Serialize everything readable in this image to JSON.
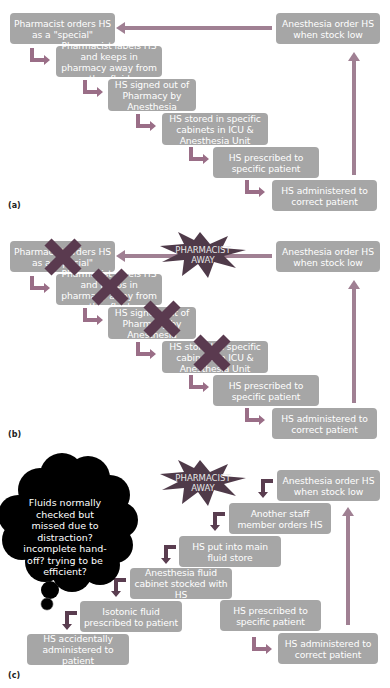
{
  "colors": {
    "box_fill": "#a6a6a6",
    "box_text": "#ffffff",
    "elbow_arrow": "#9a6e87",
    "long_arrow": "#a08093",
    "cross": "#5a3a4f",
    "star_fill": "#4f3a49",
    "dark_arrow": "#5a3d50",
    "cloud": "#000000"
  },
  "panel_a": {
    "label": "(a)",
    "boxes": [
      "Pharmacist orders HS as a \"special\"",
      "Pharmacist labels HS and keeps in pharmacy away from other fluids",
      "HS signed out of Pharmacy by Anesthesia",
      "HS stored in specific cabinets in ICU & Anesthesia Unit",
      "HS prescribed to specific patient",
      "HS administered to correct patient",
      "Anesthesia order HS when stock low"
    ]
  },
  "panel_b": {
    "label": "(b)",
    "star": "PHARMACIST AWAY",
    "boxes": [
      "Pharmacist orders HS as a \"special\"",
      "Pharmacist labels HS and keeps in pharmacy away from other fluids",
      "HS signed out of Pharmacy by Anesthesia",
      "HS stored in specific cabinets in ICU & Anesthesia Unit",
      "HS prescribed to specific patient",
      "HS administered to correct patient",
      "Anesthesia order HS when stock low"
    ],
    "crossed_steps": 4
  },
  "panel_c": {
    "label": "(c)",
    "star": "PHARMACIST AWAY",
    "cloud": "Fluids normally checked but missed due to distraction? incomplete hand-off? trying to be efficient?",
    "boxes": {
      "anesthesia_order": "Anesthesia order HS when stock low",
      "another_staff": "Another staff member orders HS",
      "main_store": "HS put into main fluid store",
      "cabinet": "Anesthesia fluid cabinet stocked with HS",
      "isotonic": "Isotonic fluid prescribed to patient",
      "accident": "HS accidentally administered to patient",
      "prescribed": "HS prescribed to specific patient",
      "administered": "HS administered to correct patient"
    }
  }
}
